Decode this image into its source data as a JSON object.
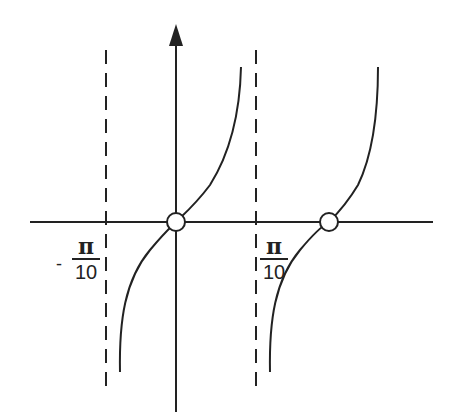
{
  "diagram": {
    "type": "function-graph",
    "function_description": "tangent-like periodic curve with vertical asymptotes",
    "labels": {
      "left_asymptote": {
        "sign": "-",
        "numerator": "π",
        "denominator": "10"
      },
      "right_asymptote": {
        "numerator": "π",
        "denominator": "10"
      }
    },
    "zeros_marked": 2,
    "colors": {
      "stroke": "#222222",
      "background": "#ffffff"
    }
  }
}
